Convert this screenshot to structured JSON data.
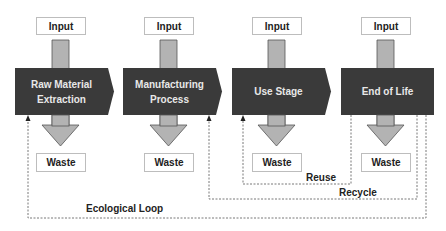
{
  "diagram": {
    "stages": [
      {
        "label_line1": "Raw Material",
        "label_line2": "Extraction",
        "input": "Input",
        "waste": "Waste"
      },
      {
        "label_line1": "Manufacturing",
        "label_line2": "Process",
        "input": "Input",
        "waste": "Waste"
      },
      {
        "label_line1": "Use Stage",
        "label_line2": "",
        "input": "Input",
        "waste": "Waste"
      },
      {
        "label_line1": "End of Life",
        "label_line2": "",
        "input": "Input",
        "waste": "Waste"
      }
    ],
    "loops": {
      "reuse": "Reuse",
      "recycle": "Recycle",
      "ecological": "Ecological Loop"
    },
    "colors": {
      "stage_fill": "#3a3a3a",
      "arrow_fill": "#b3b3b3",
      "io_border": "#bdbdbd",
      "loop_line": "#555555"
    }
  }
}
